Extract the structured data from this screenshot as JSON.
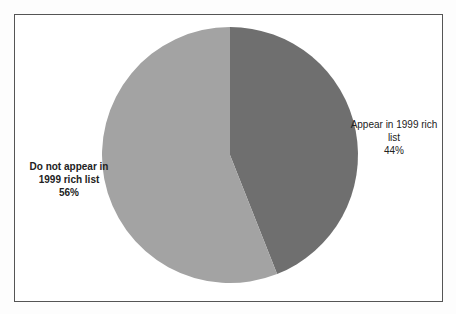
{
  "chart_data": {
    "type": "pie",
    "title": "",
    "categories": [
      "Appear in 1999 rich list",
      "Do not appear in 1999 rich list"
    ],
    "values": [
      44,
      56
    ],
    "unit": "%",
    "colors": [
      "#6f6f6f",
      "#a3a3a3"
    ],
    "start_angle_deg": 90,
    "direction": "clockwise",
    "legend": "none",
    "data_labels": [
      {
        "line1": "Appear in 1999 rich",
        "line2": "list",
        "pct": "44%"
      },
      {
        "line1": "Do not appear in",
        "line2": "1999 rich list",
        "pct": "56%"
      }
    ]
  }
}
